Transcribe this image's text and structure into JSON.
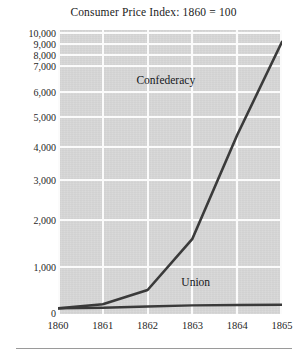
{
  "chart_data": {
    "type": "line",
    "title": "Consumer Price Index: 1860 = 100",
    "xlabel": "",
    "ylabel": "",
    "x": [
      1860,
      1861,
      1862,
      1863,
      1864,
      1865
    ],
    "xtick_labels": [
      "1860",
      "1861",
      "1862",
      "1863",
      "1864",
      "1865"
    ],
    "ytick_labels": [
      "0",
      "1,000",
      "2,000",
      "3,000",
      "4,000",
      "5,000",
      "6,000",
      "7,000",
      "8,000",
      "9,000",
      "10,000"
    ],
    "ytick_values": [
      0,
      1000,
      2000,
      3000,
      4000,
      5000,
      6000,
      7000,
      8000,
      9000,
      10000
    ],
    "yscale": "nonlinear-compressed",
    "ylim": [
      0,
      10000
    ],
    "xlim": [
      1860,
      1865
    ],
    "grid": true,
    "grid_color": "#fbfbfb",
    "plot_background": "#d6d6d6",
    "legend_position": "inline-annotations",
    "series": [
      {
        "name": "Confederacy",
        "color": "#3a3a3a",
        "values": [
          100,
          190,
          500,
          1600,
          4400,
          9200
        ],
        "label_x": 1863.0,
        "label_y": 6400
      },
      {
        "name": "Union",
        "color": "#3a3a3a",
        "values": [
          100,
          115,
          140,
          165,
          175,
          180
        ],
        "label_x": 1863.2,
        "label_y": 640
      }
    ],
    "annotations": [
      {
        "text": "Confederacy",
        "x": 1863.0,
        "y": 6400
      },
      {
        "text": "Union",
        "x": 1863.2,
        "y": 640
      }
    ]
  },
  "figure": {
    "title": "Consumer Price Index: 1860 = 100"
  }
}
